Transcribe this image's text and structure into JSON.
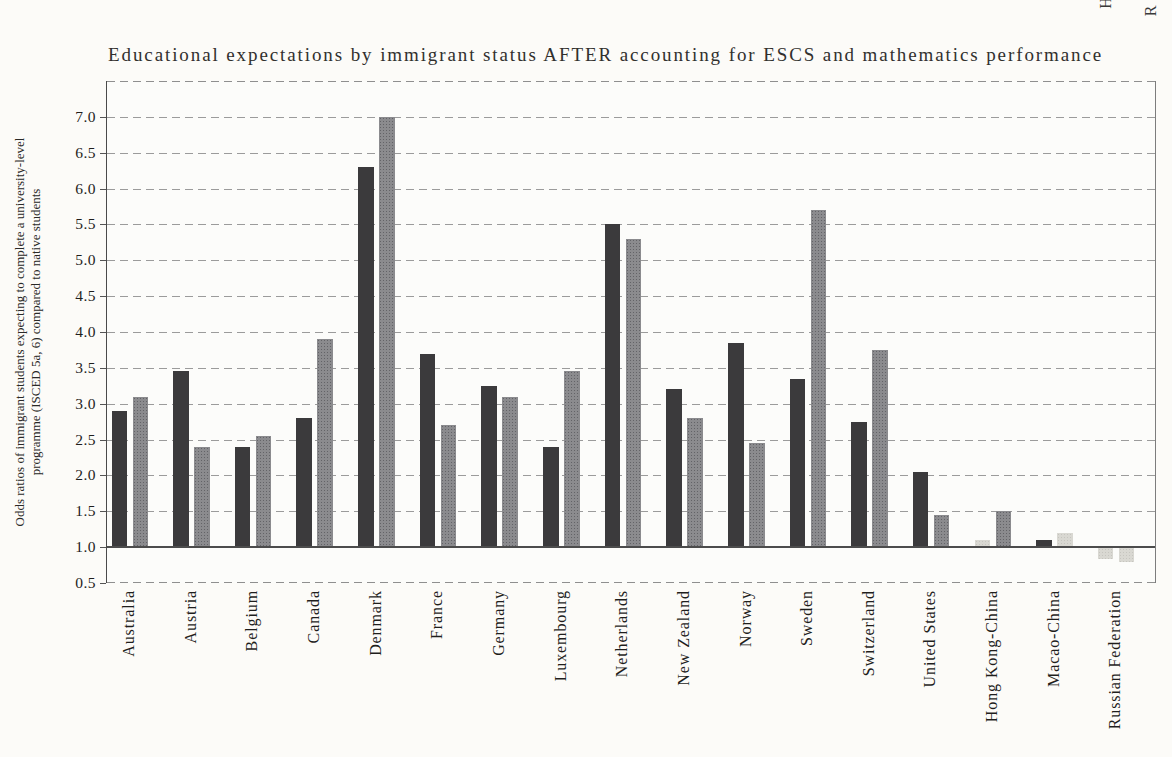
{
  "title": "Educational expectations by immigrant status AFTER accounting for ESCS and mathematics performance",
  "top_edge_fragments": [
    "H",
    "R"
  ],
  "y_axis": {
    "label_line1": "Odds ratios of immigrant students expecting to complete a university-level",
    "label_line2": "programme (ISCED 5a, 6) compared to native students",
    "tick_labels": [
      "7.0",
      "6.5",
      "6.0",
      "5.5",
      "5.0",
      "4.5",
      "4.0",
      "3.5",
      "3.0",
      "2.5",
      "2.0",
      "1.5",
      "1.0",
      "0.5"
    ]
  },
  "chart_data": {
    "type": "bar",
    "title": "Educational expectations by immigrant status AFTER accounting for ESCS and mathematics performance",
    "ylabel": "Odds ratios of immigrant students expecting to complete a university-level programme (ISCED 5a, 6) compared to native students",
    "xlabel": "",
    "ylim": [
      0.5,
      7.5
    ],
    "baseline": 1.0,
    "grid": "dashed horizontal lines every 0.5",
    "legend": "none visible",
    "categories": [
      "Australia",
      "Austria",
      "Belgium",
      "Canada",
      "Denmark",
      "France",
      "Germany",
      "Luxembourg",
      "Netherlands",
      "New Zealand",
      "Norway",
      "Sweden",
      "Switzerland",
      "United States",
      "Hong Kong-China",
      "Macao-China",
      "Russian Federation"
    ],
    "series": [
      {
        "name": "left-bar-dark",
        "color": "#3b3a3c",
        "values": [
          2.9,
          3.45,
          2.4,
          2.8,
          6.3,
          3.7,
          3.25,
          2.4,
          5.5,
          3.2,
          3.85,
          3.35,
          2.75,
          2.05,
          1.1,
          1.1,
          0.85
        ]
      },
      {
        "name": "right-bar-gray",
        "color": "#8b8b8e",
        "values": [
          3.1,
          2.4,
          2.55,
          3.9,
          7.0,
          2.7,
          3.1,
          3.45,
          5.3,
          2.8,
          2.45,
          5.7,
          3.75,
          1.45,
          1.5,
          1.2,
          0.8
        ]
      }
    ],
    "muted_color": "#d9d8d2",
    "muted_bars": [
      {
        "category_index": 14,
        "series_index": 0
      },
      {
        "category_index": 15,
        "series_index": 1
      },
      {
        "category_index": 16,
        "series_index": 0
      },
      {
        "category_index": 16,
        "series_index": 1
      }
    ],
    "note": "bars rise from the 1.0 odds-ratio baseline; Russian Federation bars hang below 1.0"
  }
}
